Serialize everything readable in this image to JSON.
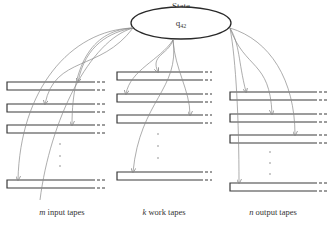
{
  "title": "State",
  "state": {
    "label": "q",
    "subscript": "42",
    "cx": 181,
    "cy": 23,
    "rx": 50,
    "ry": 16
  },
  "groups": [
    {
      "id": "input",
      "caption_var": "m",
      "caption_text": " input tapes",
      "caption_x": 38,
      "x": 7,
      "solid_end": 92,
      "dash_end": 106,
      "tape_tops": [
        82,
        104,
        125,
        180
      ],
      "dots_x": 60,
      "dots_y": [
        144,
        156,
        166
      ]
    },
    {
      "id": "work",
      "caption_var": "k",
      "caption_text": " work tapes",
      "caption_x": 143,
      "x": 117,
      "solid_end": 200,
      "dash_end": 212,
      "tape_tops": [
        72,
        94,
        115,
        172
      ],
      "dots_x": 158,
      "dots_y": [
        134,
        146,
        158
      ]
    },
    {
      "id": "output",
      "caption_var": "n",
      "caption_text": " output tapes",
      "caption_x": 260,
      "x": 230,
      "solid_end": 314,
      "dash_end": 328,
      "tape_tops": [
        92,
        114,
        135,
        183
      ],
      "dots_x": 270,
      "dots_y": [
        152,
        163,
        174
      ]
    }
  ],
  "colors": {
    "line": "#3a3a3a",
    "arrow": "#8a8a8a",
    "text": "#333333"
  }
}
